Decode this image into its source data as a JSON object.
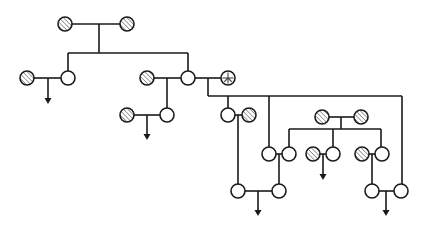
{
  "diagram": {
    "type": "pedigree",
    "width": 431,
    "height": 231,
    "colors": {
      "line": "#1a1a1a",
      "open_fill": "#ffffff",
      "hatch_stroke": "#8a8a8a",
      "background": "#ffffff"
    },
    "node_radius": 7,
    "legend": {
      "open": "unaffected / open circle",
      "hatched": "hatched (affected) circle",
      "peace": "circle with peace-sign mark"
    },
    "nodes": [
      {
        "id": "g1a",
        "x": 65,
        "y": 24,
        "style": "hatched"
      },
      {
        "id": "g1b",
        "x": 127,
        "y": 24,
        "style": "hatched"
      },
      {
        "id": "g2a_sp",
        "x": 27,
        "y": 78,
        "style": "hatched"
      },
      {
        "id": "g2a",
        "x": 68,
        "y": 78,
        "style": "open"
      },
      {
        "id": "g2b_sp",
        "x": 147,
        "y": 78,
        "style": "hatched"
      },
      {
        "id": "g2b",
        "x": 188,
        "y": 78,
        "style": "open"
      },
      {
        "id": "g2b_sp2",
        "x": 228,
        "y": 78,
        "style": "peace"
      },
      {
        "id": "g3a_sp",
        "x": 127,
        "y": 115,
        "style": "hatched"
      },
      {
        "id": "g3a",
        "x": 167,
        "y": 115,
        "style": "open"
      },
      {
        "id": "g3b",
        "x": 228,
        "y": 115,
        "style": "open"
      },
      {
        "id": "g3b_sp",
        "x": 249,
        "y": 115,
        "style": "hatched"
      },
      {
        "id": "x1",
        "x": 322,
        "y": 117,
        "style": "hatched"
      },
      {
        "id": "x2",
        "x": 361,
        "y": 117,
        "style": "hatched"
      },
      {
        "id": "g3c",
        "x": 269,
        "y": 154,
        "style": "open"
      },
      {
        "id": "y1",
        "x": 289,
        "y": 154,
        "style": "open"
      },
      {
        "id": "y2_sp",
        "x": 313,
        "y": 154,
        "style": "hatched"
      },
      {
        "id": "y2",
        "x": 333,
        "y": 154,
        "style": "open"
      },
      {
        "id": "y3_sp",
        "x": 362,
        "y": 154,
        "style": "hatched"
      },
      {
        "id": "y3",
        "x": 382,
        "y": 154,
        "style": "open"
      },
      {
        "id": "g4a",
        "x": 238,
        "y": 191,
        "style": "open"
      },
      {
        "id": "g4b",
        "x": 279,
        "y": 191,
        "style": "open"
      },
      {
        "id": "g4c",
        "x": 372,
        "y": 191,
        "style": "open"
      },
      {
        "id": "g4d",
        "x": 401,
        "y": 191,
        "style": "open"
      }
    ],
    "lines": [
      [
        72,
        24,
        120,
        24
      ],
      [
        99,
        24,
        99,
        53
      ],
      [
        68,
        53,
        188,
        53
      ],
      [
        68,
        53,
        68,
        71
      ],
      [
        188,
        53,
        188,
        71
      ],
      [
        34,
        78,
        61,
        78
      ],
      [
        154,
        78,
        181,
        78
      ],
      [
        195,
        78,
        221,
        78
      ],
      [
        167,
        78,
        167,
        108
      ],
      [
        134,
        115,
        160,
        115
      ],
      [
        208,
        78,
        208,
        96
      ],
      [
        208,
        96,
        402,
        96
      ],
      [
        228,
        96,
        228,
        108
      ],
      [
        269,
        96,
        269,
        147
      ],
      [
        402,
        96,
        402,
        184
      ],
      [
        235,
        115,
        242,
        115
      ],
      [
        238,
        115,
        238,
        184
      ],
      [
        329,
        117,
        354,
        117
      ],
      [
        341,
        117,
        341,
        129
      ],
      [
        289,
        129,
        381,
        129
      ],
      [
        289,
        129,
        289,
        147
      ],
      [
        333,
        129,
        333,
        147
      ],
      [
        381,
        129,
        381,
        147
      ],
      [
        276,
        154,
        282,
        154
      ],
      [
        279,
        154,
        279,
        184
      ],
      [
        320,
        154,
        326,
        154
      ],
      [
        369,
        154,
        375,
        154
      ],
      [
        372,
        154,
        372,
        184
      ],
      [
        245,
        191,
        272,
        191
      ],
      [
        379,
        191,
        394,
        191
      ]
    ],
    "arrows": [
      {
        "x": 48,
        "y1": 78,
        "y2": 104
      },
      {
        "x": 147,
        "y1": 115,
        "y2": 140
      },
      {
        "x": 323,
        "y1": 154,
        "y2": 180
      },
      {
        "x": 258,
        "y1": 191,
        "y2": 216
      },
      {
        "x": 386,
        "y1": 191,
        "y2": 216
      }
    ]
  }
}
